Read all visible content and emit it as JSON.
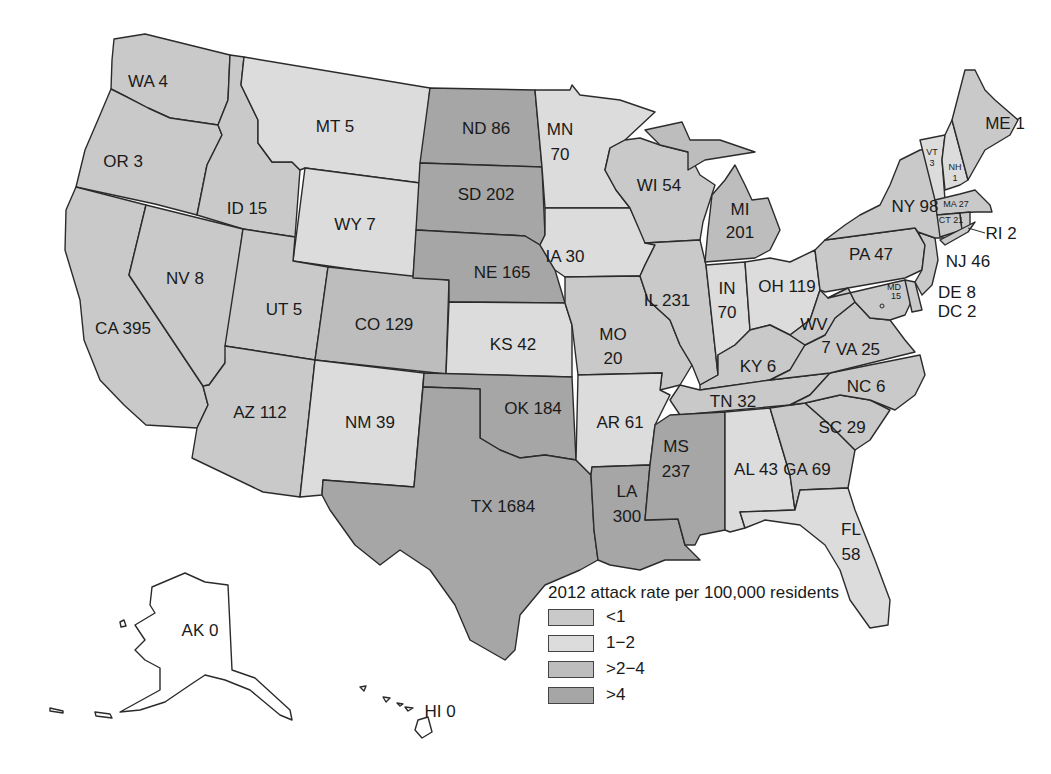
{
  "legend": {
    "title": "2012 attack rate per 100,000 residents",
    "items": [
      {
        "label": "<1",
        "color": "#c9c9c9"
      },
      {
        "label": "1−2",
        "color": "#dcdcdc"
      },
      {
        "label": ">2−4",
        "color": "#bdbdbd"
      },
      {
        "label": ">4",
        "color": "#a6a6a6"
      }
    ]
  },
  "colors": {
    "none": "#ffffff",
    "border": "#2b2b2b"
  },
  "states": [
    {
      "abbr": "WA",
      "value": 4,
      "label": "WA 4",
      "cat": 0
    },
    {
      "abbr": "OR",
      "value": 3,
      "label": "OR 3",
      "cat": 0
    },
    {
      "abbr": "CA",
      "value": 395,
      "label": "CA 395",
      "cat": 0
    },
    {
      "abbr": "ID",
      "value": 15,
      "label": "ID 15",
      "cat": 0
    },
    {
      "abbr": "NV",
      "value": 8,
      "label": "NV 8",
      "cat": 0
    },
    {
      "abbr": "MT",
      "value": 5,
      "label": "MT 5",
      "cat": 1
    },
    {
      "abbr": "WY",
      "value": 7,
      "label": "WY 7",
      "cat": 1
    },
    {
      "abbr": "UT",
      "value": 5,
      "label": "UT 5",
      "cat": 0
    },
    {
      "abbr": "AZ",
      "value": 112,
      "label": "AZ 112",
      "cat": 0
    },
    {
      "abbr": "CO",
      "value": 129,
      "label": "CO 129",
      "cat": 2
    },
    {
      "abbr": "NM",
      "value": 39,
      "label": "NM 39",
      "cat": 1
    },
    {
      "abbr": "ND",
      "value": 86,
      "label": "ND 86",
      "cat": 3
    },
    {
      "abbr": "SD",
      "value": 202,
      "label": "SD 202",
      "cat": 3
    },
    {
      "abbr": "NE",
      "value": 165,
      "label": "NE 165",
      "cat": 3
    },
    {
      "abbr": "KS",
      "value": 42,
      "label": "KS 42",
      "cat": 1
    },
    {
      "abbr": "OK",
      "value": 184,
      "label": "OK 184",
      "cat": 3
    },
    {
      "abbr": "TX",
      "value": 1684,
      "label": "TX 1684",
      "cat": 3
    },
    {
      "abbr": "MN",
      "value": 70,
      "label": "MN 70",
      "cat": 1
    },
    {
      "abbr": "IA",
      "value": 30,
      "label": "IA 30",
      "cat": 1
    },
    {
      "abbr": "MO",
      "value": 20,
      "label": "MO 20",
      "cat": 0
    },
    {
      "abbr": "AR",
      "value": 61,
      "label": "AR 61",
      "cat": 1
    },
    {
      "abbr": "LA",
      "value": 300,
      "label": "LA 300",
      "cat": 3
    },
    {
      "abbr": "WI",
      "value": 54,
      "label": "WI 54",
      "cat": 0
    },
    {
      "abbr": "IL",
      "value": 231,
      "label": "IL 231",
      "cat": 0
    },
    {
      "abbr": "MI",
      "value": 201,
      "label": "MI 201",
      "cat": 2
    },
    {
      "abbr": "IN",
      "value": 70,
      "label": "IN 70",
      "cat": 1
    },
    {
      "abbr": "OH",
      "value": 119,
      "label": "OH 119",
      "cat": 1
    },
    {
      "abbr": "KY",
      "value": 6,
      "label": "KY 6",
      "cat": 0
    },
    {
      "abbr": "TN",
      "value": 32,
      "label": "TN 32",
      "cat": 0
    },
    {
      "abbr": "MS",
      "value": 237,
      "label": "MS 237",
      "cat": 3
    },
    {
      "abbr": "AL",
      "value": 43,
      "label": "AL 43",
      "cat": 1
    },
    {
      "abbr": "GA",
      "value": 69,
      "label": "GA 69",
      "cat": 0
    },
    {
      "abbr": "FL",
      "value": 58,
      "label": "FL 58",
      "cat": 1
    },
    {
      "abbr": "SC",
      "value": 29,
      "label": "SC 29",
      "cat": 0
    },
    {
      "abbr": "NC",
      "value": 6,
      "label": "NC 6",
      "cat": 0
    },
    {
      "abbr": "VA",
      "value": 25,
      "label": "VA 25",
      "cat": 0
    },
    {
      "abbr": "WV",
      "value": 7,
      "label": "WV 7",
      "cat": 0
    },
    {
      "abbr": "PA",
      "value": 47,
      "label": "PA 47",
      "cat": 0
    },
    {
      "abbr": "NY",
      "value": 98,
      "label": "NY 98",
      "cat": 0
    },
    {
      "abbr": "VT",
      "value": 3,
      "label": "VT 3",
      "cat": 1
    },
    {
      "abbr": "NH",
      "value": 1,
      "label": "NH 1",
      "cat": 1
    },
    {
      "abbr": "ME",
      "value": 1,
      "label": "ME 1",
      "cat": 0
    },
    {
      "abbr": "MA",
      "value": 27,
      "label": "MA 27",
      "cat": 0
    },
    {
      "abbr": "CT",
      "value": 21,
      "label": "CT 21",
      "cat": 0
    },
    {
      "abbr": "RI",
      "value": 2,
      "label": "RI 2",
      "cat": 0
    },
    {
      "abbr": "NJ",
      "value": 46,
      "label": "NJ 46",
      "cat": 0
    },
    {
      "abbr": "DE",
      "value": 8,
      "label": "DE 8",
      "cat": 0
    },
    {
      "abbr": "MD",
      "value": 15,
      "label": "MD 15",
      "cat": 0
    },
    {
      "abbr": "DC",
      "value": 2,
      "label": "DC 2",
      "cat": 0
    },
    {
      "abbr": "AK",
      "value": 0,
      "label": "AK 0",
      "cat": -1
    },
    {
      "abbr": "HI",
      "value": 0,
      "label": "HI 0",
      "cat": -1
    }
  ]
}
